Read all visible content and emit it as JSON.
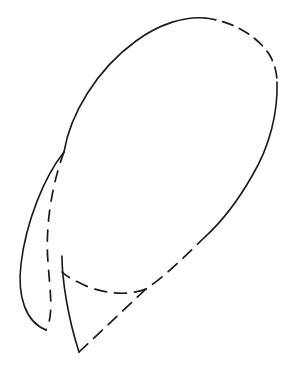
{
  "figure": {
    "type": "line-drawing",
    "background_color": "#ffffff",
    "stroke_color": "#1a1a1a",
    "canvas": {
      "width": 298,
      "height": 372
    },
    "stroke_widths": {
      "solid": 1.6,
      "dashed": 1.7
    },
    "dash_patterns": {
      "ellipse_top": "11 7",
      "ellipse_bottom": "12 8",
      "petal_inner": "11 9",
      "wedge": "12 8"
    },
    "ellipse": {
      "label": "main ellipse",
      "center_x": 170,
      "center_y": 158,
      "semi_major": 128,
      "semi_minor": 78,
      "rotation_deg": -36
    },
    "key_points": {
      "cusp": {
        "x": 64,
        "y": 152
      },
      "top_dash_start": {
        "x": 205,
        "y": 18
      },
      "right_dash_end": {
        "x": 277,
        "y": 82
      },
      "lower_right_solid_end": {
        "x": 206,
        "y": 236
      },
      "bottom_junction": {
        "x": 146,
        "y": 289
      },
      "bottom_arc_left_end": {
        "x": 62,
        "y": 272
      },
      "petal_tip": {
        "x": 46,
        "y": 330
      },
      "wedge_vertex": {
        "x": 79,
        "y": 352
      }
    },
    "paths": [
      {
        "name": "ellipse-upper-left-solid-arc",
        "style": "solid",
        "d": "M 64 152 C 70 115 96 70 136 41 C 159 24 185 16 205 18"
      },
      {
        "name": "ellipse-top-right-dashed-arc",
        "style": "dashed",
        "d": "M 205 18 C 232 21 256 35 269 54 C 274 62 277 72 277 82"
      },
      {
        "name": "ellipse-right-solid-arc",
        "style": "solid",
        "d": "M 277 82 C 278 112 270 146 252 176 C 236 204 219 224 206 236"
      },
      {
        "name": "ellipse-lower-left-dashed-arc",
        "style": "dashed",
        "d": "M 206 236 C 189 252 167 275 146 289"
      },
      {
        "name": "ellipse-bottom-dashed-arc",
        "style": "dashed",
        "d": "M 146 289 C 126 297 99 293 80 283 C 71 279 65 275 62 272"
      },
      {
        "name": "petal-outer-solid-curve",
        "style": "solid",
        "d": "M 64 152 C 44 177 26 222 21 264 C 17 297 26 322 46 330"
      },
      {
        "name": "petal-inner-dashed-curve",
        "style": "dashed",
        "d": "M 64 152 C 52 184 45 226 48 262 C 50 292 54 315 46 330"
      },
      {
        "name": "wedge-left-solid-edge",
        "style": "solid",
        "d": "M 62 256 C 62 280 68 318 79 352"
      },
      {
        "name": "wedge-right-dashed-edge",
        "style": "dashed",
        "d": "M 79 352 L 146 289"
      }
    ]
  }
}
